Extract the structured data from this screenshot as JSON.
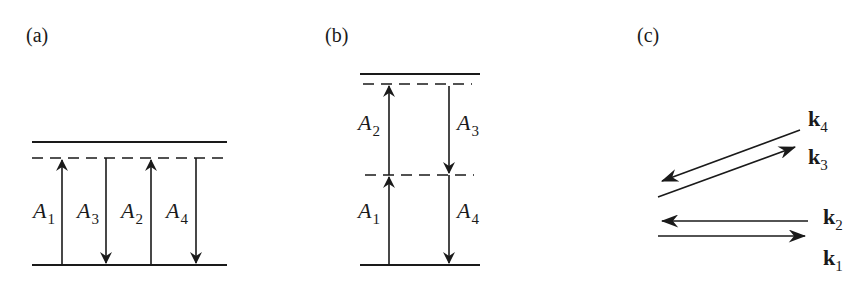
{
  "panels": {
    "a": {
      "label": "(a)",
      "transitions": [
        {
          "sym": "A",
          "sub": "1",
          "dir": "up"
        },
        {
          "sym": "A",
          "sub": "3",
          "dir": "down"
        },
        {
          "sym": "A",
          "sub": "2",
          "dir": "up"
        },
        {
          "sym": "A",
          "sub": "4",
          "dir": "down"
        }
      ]
    },
    "b": {
      "label": "(b)",
      "transitions": [
        {
          "sym": "A",
          "sub": "2",
          "dir": "up"
        },
        {
          "sym": "A",
          "sub": "3",
          "dir": "down"
        },
        {
          "sym": "A",
          "sub": "1",
          "dir": "up"
        },
        {
          "sym": "A",
          "sub": "4",
          "dir": "down"
        }
      ]
    },
    "c": {
      "label": "(c)",
      "vectors": [
        {
          "sym": "k",
          "sub": "4"
        },
        {
          "sym": "k",
          "sub": "3"
        },
        {
          "sym": "k",
          "sub": "2"
        },
        {
          "sym": "k",
          "sub": "1"
        }
      ]
    }
  },
  "colors": {
    "ink": "#1a1a1a",
    "background": "#ffffff"
  }
}
